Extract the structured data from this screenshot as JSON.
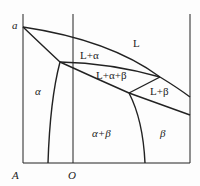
{
  "diagram": {
    "type": "binary eutectic phase diagram",
    "axis_labels": {
      "origin": "A",
      "composition_marker": "O",
      "melting_point": "a"
    },
    "regions": {
      "liquid": "L",
      "liquid_alpha": "L+α",
      "three_phase": "L+α+β",
      "liquid_beta": "L+β",
      "alpha": "α",
      "alpha_beta": "α+β",
      "beta": "β"
    }
  }
}
